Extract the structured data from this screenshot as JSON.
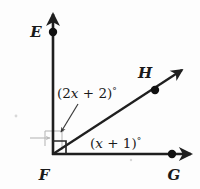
{
  "figure": {
    "background_color": "#fdfdfd",
    "line_color": "#1f1f1f",
    "points": [
      {
        "id": "E",
        "label": "E",
        "x": 53,
        "y": 32,
        "label_x": 36,
        "label_y": 37
      },
      {
        "id": "H",
        "label": "H",
        "x": 155,
        "y": 90,
        "label_x": 142,
        "label_y": 78
      },
      {
        "id": "F",
        "label": "F",
        "x": 53,
        "y": 155,
        "label_x": 40,
        "label_y": 177
      },
      {
        "id": "G",
        "label": "G",
        "x": 172,
        "y": 154,
        "label_x": 166,
        "label_y": 177
      }
    ],
    "rays": [
      {
        "id": "FE",
        "from": "F",
        "to": "E",
        "direction": "up",
        "arrow": true
      },
      {
        "id": "FG",
        "from": "F",
        "to": "G",
        "direction": "right",
        "arrow": true
      },
      {
        "id": "FH",
        "from": "F",
        "to": "H",
        "direction": "up-right",
        "arrow": true
      }
    ],
    "angles": [
      {
        "id": "EFH",
        "expression": "(2x + 2)°",
        "parts": {
          "open": "(2",
          "var": "x",
          "mid": " + 2)",
          "deg": "°"
        },
        "label_x": 57,
        "label_y": 98,
        "leader": true
      },
      {
        "id": "HFG",
        "expression": "(x + 1)°",
        "parts": {
          "open": "(",
          "var": "x",
          "mid": " + 1)",
          "deg": "°"
        },
        "label_x": 90,
        "label_y": 148,
        "leader": false
      }
    ],
    "right_angle_marker": {
      "id": "EFG",
      "present": true,
      "vertex": "F",
      "size": 13
    }
  }
}
